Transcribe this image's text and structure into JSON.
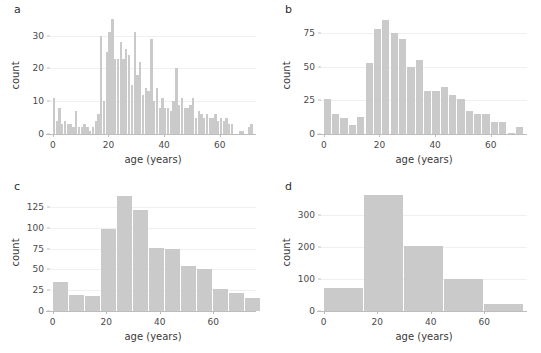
{
  "figure": {
    "background": "#ffffff",
    "bar_color": "#cacaca",
    "grid_color": "#f0f0f0",
    "axis_color": "#bdbdbd"
  },
  "panels": [
    {
      "label": "a",
      "id": "panel-a",
      "xlabel": "age (years)",
      "ylabel": "count",
      "yticks": [
        0,
        10,
        20,
        30
      ],
      "xticks": [
        0,
        20,
        40,
        60
      ],
      "ylim": [
        0,
        36
      ],
      "xlim": [
        -1,
        73
      ]
    },
    {
      "label": "b",
      "id": "panel-b",
      "xlabel": "age (years)",
      "ylabel": "count",
      "yticks": [
        0,
        25,
        50,
        75
      ],
      "xticks": [
        0,
        20,
        40,
        60
      ],
      "ylim": [
        0,
        88
      ],
      "xlim": [
        -1,
        73
      ]
    },
    {
      "label": "c",
      "id": "panel-c",
      "xlabel": "age (years)",
      "ylabel": "count",
      "yticks": [
        0,
        25,
        50,
        75,
        100,
        125
      ],
      "xticks": [
        0,
        20,
        40,
        60
      ],
      "ylim": [
        0,
        142
      ],
      "xlim": [
        -1,
        76
      ]
    },
    {
      "label": "d",
      "id": "panel-d",
      "xlabel": "age (years)",
      "ylabel": "count",
      "yticks": [
        0,
        100,
        200,
        300
      ],
      "xticks": [
        0,
        20,
        40,
        60
      ],
      "ylim": [
        0,
        370
      ],
      "xlim": [
        -1,
        76
      ]
    }
  ],
  "chart_data": [
    {
      "type": "bar",
      "panel": "a",
      "title": "",
      "xlabel": "age (years)",
      "ylabel": "count",
      "binwidth": 1,
      "grid": true,
      "legend": "none",
      "xlim": [
        -1,
        73
      ],
      "ylim": [
        0,
        36
      ],
      "xticks": [
        0,
        20,
        40,
        60
      ],
      "yticks": [
        0,
        10,
        20,
        30
      ],
      "x": [
        0,
        1,
        2,
        3,
        4,
        5,
        6,
        7,
        8,
        9,
        10,
        11,
        12,
        13,
        14,
        15,
        16,
        17,
        18,
        19,
        20,
        21,
        22,
        23,
        24,
        25,
        26,
        27,
        28,
        29,
        30,
        31,
        32,
        33,
        34,
        35,
        36,
        37,
        38,
        39,
        40,
        41,
        42,
        43,
        44,
        45,
        46,
        47,
        48,
        49,
        50,
        51,
        52,
        53,
        54,
        55,
        56,
        57,
        58,
        59,
        60,
        61,
        62,
        63,
        64,
        65,
        66,
        67,
        68,
        69,
        70,
        71
      ],
      "values": [
        11,
        4,
        8,
        3,
        4,
        3,
        3,
        2,
        7,
        2,
        2,
        3,
        2,
        1,
        2,
        4,
        6,
        30,
        10,
        25,
        31,
        35,
        23,
        23,
        28,
        23,
        26,
        24,
        15,
        31,
        18,
        22,
        12,
        14,
        13,
        29,
        10,
        14,
        8,
        11,
        8,
        8,
        7,
        10,
        20,
        9,
        11,
        8,
        8,
        9,
        11,
        5,
        7,
        6,
        5,
        6,
        5,
        5,
        6,
        4,
        5,
        4,
        5,
        3,
        3,
        0,
        0,
        1,
        1,
        0,
        2,
        3
      ]
    },
    {
      "type": "bar",
      "panel": "b",
      "title": "",
      "xlabel": "age (years)",
      "ylabel": "count",
      "binwidth": 3,
      "grid": true,
      "legend": "none",
      "xlim": [
        -1,
        73
      ],
      "ylim": [
        0,
        88
      ],
      "xticks": [
        0,
        20,
        40,
        60
      ],
      "yticks": [
        0,
        25,
        50,
        75
      ],
      "bin_starts": [
        0,
        3,
        6,
        9,
        12,
        15,
        18,
        21,
        24,
        27,
        30,
        33,
        36,
        39,
        42,
        45,
        48,
        51,
        54,
        57,
        60,
        63,
        66,
        69
      ],
      "values": [
        26,
        15,
        12,
        7,
        13,
        53,
        78,
        85,
        75,
        71,
        50,
        55,
        32,
        32,
        35,
        29,
        26,
        17,
        15,
        15,
        9,
        9,
        1,
        5
      ]
    },
    {
      "type": "bar",
      "panel": "c",
      "title": "",
      "xlabel": "age (years)",
      "ylabel": "count",
      "binwidth": 6,
      "grid": true,
      "legend": "none",
      "xlim": [
        -1,
        76
      ],
      "ylim": [
        0,
        142
      ],
      "xticks": [
        0,
        20,
        40,
        60
      ],
      "yticks": [
        0,
        25,
        50,
        75,
        100,
        125
      ],
      "bin_starts": [
        0,
        6,
        12,
        18,
        24,
        30,
        36,
        42,
        48,
        54,
        60,
        66,
        72
      ],
      "values": [
        35,
        19,
        18,
        99,
        138,
        121,
        76,
        75,
        54,
        51,
        26,
        22,
        16
      ]
    },
    {
      "type": "bar",
      "panel": "d",
      "title": "",
      "xlabel": "age (years)",
      "ylabel": "count",
      "binwidth": 15,
      "grid": true,
      "legend": "none",
      "xlim": [
        -1,
        76
      ],
      "ylim": [
        0,
        370
      ],
      "xticks": [
        0,
        20,
        40,
        60
      ],
      "yticks": [
        0,
        100,
        200,
        300
      ],
      "bin_starts": [
        0,
        15,
        30,
        45,
        60
      ],
      "values": [
        73,
        365,
        203,
        100,
        22
      ]
    }
  ]
}
